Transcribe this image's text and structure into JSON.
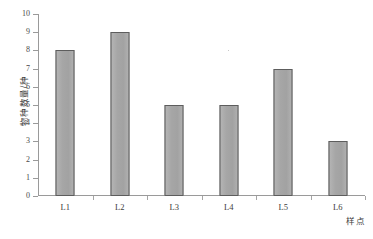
{
  "chart_data": {
    "type": "bar",
    "title": "",
    "subtitle": "",
    "categories": [
      "L1",
      "L2",
      "L3",
      "L4",
      "L5",
      "L6"
    ],
    "values": [
      8,
      9,
      5,
      5,
      7,
      3
    ],
    "series": [
      {
        "name": "物种数量",
        "values": [
          8,
          9,
          5,
          5,
          7,
          3
        ]
      }
    ],
    "xlabel": "样点",
    "ylabel": "物种数量/种",
    "ylim": [
      0,
      10
    ],
    "yticks": [
      10,
      9,
      8,
      7,
      6,
      5,
      4,
      3,
      2,
      1,
      0
    ],
    "ytick_labels": [
      "10",
      "9",
      "8",
      "7",
      "6",
      "5",
      "4",
      "3",
      "2",
      "1",
      "0"
    ],
    "grid": false,
    "legend": false,
    "legend_position": "none",
    "bar_color": "#a8a8a8",
    "bar_edge_color": "#5d5d5d",
    "axis_color": "#9a9a9a",
    "background": "#ffffff"
  }
}
